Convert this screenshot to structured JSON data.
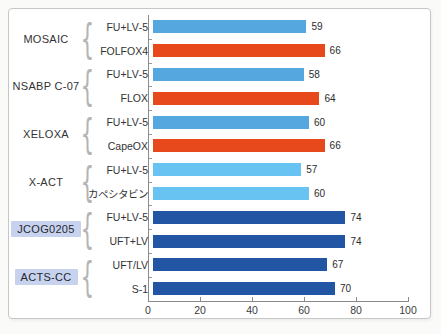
{
  "figure": {
    "background": "#ffffff",
    "border_color": "#c7c7c7"
  },
  "chart_data": {
    "type": "bar",
    "orientation": "horizontal",
    "title": "",
    "xlabel": "",
    "ylabel": "",
    "xlim": [
      0,
      100
    ],
    "x_ticks": [
      0,
      20,
      40,
      60,
      80,
      100
    ],
    "grid": false,
    "legend": "none",
    "colors": {
      "control_blue": "#55a7e0",
      "orange": "#e7481c",
      "light_blue": "#68c3f2",
      "dark_blue": "#2256a5"
    },
    "axis_color": "#8a8a8a",
    "highlight_bg": "#c7d3ee",
    "brace_glyph": "{",
    "groups": [
      {
        "trial": "MOSAIC",
        "highlighted": false,
        "arms": [
          {
            "label": "5-FU+LV",
            "value": 59,
            "color": "control_blue"
          },
          {
            "label": "FOLFOX4",
            "value": 66,
            "color": "orange"
          }
        ]
      },
      {
        "trial": "NSABP C-07",
        "highlighted": false,
        "arms": [
          {
            "label": "5-FU+LV",
            "value": 58,
            "color": "control_blue"
          },
          {
            "label": "FLOX",
            "value": 64,
            "color": "orange"
          }
        ]
      },
      {
        "trial": "XELOXA",
        "highlighted": false,
        "arms": [
          {
            "label": "5-FU+LV",
            "value": 60,
            "color": "control_blue"
          },
          {
            "label": "CapeOX",
            "value": 66,
            "color": "orange"
          }
        ]
      },
      {
        "trial": "X-ACT",
        "highlighted": false,
        "arms": [
          {
            "label": "5-FU+LV",
            "value": 57,
            "color": "light_blue"
          },
          {
            "label": "カペシタビン",
            "value": 60,
            "color": "light_blue"
          }
        ]
      },
      {
        "trial": "JCOG0205",
        "highlighted": true,
        "arms": [
          {
            "label": "5-FU+LV",
            "value": 74,
            "color": "dark_blue"
          },
          {
            "label": "UFT+LV",
            "value": 74,
            "color": "dark_blue"
          }
        ]
      },
      {
        "trial": "ACTS-CC",
        "highlighted": true,
        "arms": [
          {
            "label": "UFT/LV",
            "value": 67,
            "color": "dark_blue"
          },
          {
            "label": "S-1",
            "value": 70,
            "color": "dark_blue"
          }
        ]
      }
    ]
  }
}
